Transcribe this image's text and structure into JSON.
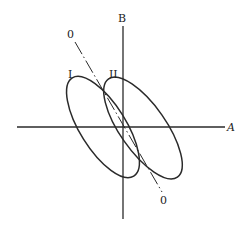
{
  "diagram": {
    "type": "ellipse-axes-diagram",
    "axes": {
      "horizontal_label": "A",
      "vertical_label": "B"
    },
    "diagonal_line": {
      "top_label": "0",
      "bottom_label": "0",
      "style": "dash-dot"
    },
    "ellipses": [
      {
        "label": "I"
      },
      {
        "label": "II"
      }
    ],
    "colors": {
      "stroke": "#2a2a2a",
      "background": "#ffffff"
    }
  }
}
